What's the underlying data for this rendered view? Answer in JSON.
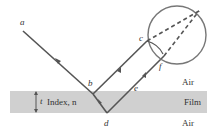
{
  "diagram": {
    "type": "thin-film interference ray diagram",
    "points": {
      "a": {
        "label": "a"
      },
      "b": {
        "label": "b"
      },
      "c": {
        "label": "c"
      },
      "d": {
        "label": "d"
      },
      "e": {
        "label": "e"
      },
      "f": {
        "label": "f"
      }
    },
    "regions": {
      "top": "Air",
      "middle": "Film",
      "bottom": "Air"
    },
    "film": {
      "thickness_label": "t",
      "index_label": "Index, n"
    },
    "colors": {
      "ray": "#555555",
      "film": "#d0d0d0",
      "lens": "#777777",
      "text": "#333333"
    }
  }
}
